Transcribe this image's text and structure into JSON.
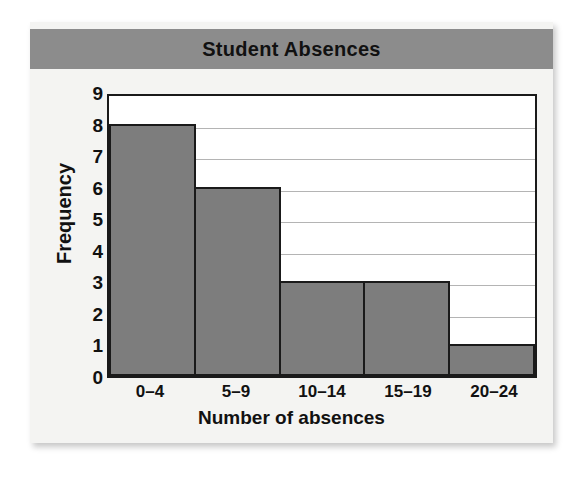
{
  "chart_data": {
    "type": "bar",
    "title": "Student Absences",
    "xlabel": "Number of absences",
    "ylabel": "Frequency",
    "categories": [
      "0–4",
      "5–9",
      "10–14",
      "15–19",
      "20–24"
    ],
    "values": [
      8,
      6,
      3,
      3,
      1
    ],
    "ylim": [
      0,
      9
    ],
    "yticks": [
      0,
      1,
      2,
      3,
      4,
      5,
      6,
      7,
      8,
      9
    ],
    "grid": true,
    "legend": null,
    "colors": {
      "bar_fill": "#7d7d7d",
      "bar_border": "#1a1a1a",
      "title_banner": "#8c8c8c",
      "gridline": "#b4b4b4",
      "card_background": "#f4f4f2",
      "plot_background": "#ffffff",
      "text": "#111111"
    }
  }
}
